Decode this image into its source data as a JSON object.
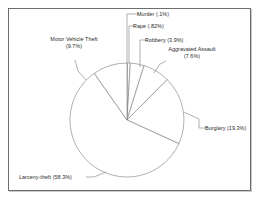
{
  "chart_data": {
    "type": "pie",
    "title": "",
    "subtitle": "",
    "xlabel": "",
    "ylabel": "",
    "legend_position": "none",
    "grid": false,
    "units": "percent",
    "start_angle_deg": 0,
    "direction": "clockwise",
    "categories": [
      "Murder",
      "Rape",
      "Robbery",
      "Aggravated Assault",
      "Burglary",
      "Larceny-theft",
      "Motor Vehicle Theft"
    ],
    "values": [
      0.1,
      0.82,
      3.9,
      7.6,
      19.3,
      58.3,
      9.7
    ],
    "slices": [
      {
        "name": "Murder",
        "value": 0.1,
        "value_text": ".1%",
        "label_line1": "Murder (.1%)",
        "label_line2": ""
      },
      {
        "name": "Rape",
        "value": 0.82,
        "value_text": ".82%",
        "label_line1": "Rape (.82%)",
        "label_line2": ""
      },
      {
        "name": "Robbery",
        "value": 3.9,
        "value_text": "3.9%",
        "label_line1": "Robbery (3.9%)",
        "label_line2": ""
      },
      {
        "name": "Aggravated Assault",
        "value": 7.6,
        "value_text": "7.6%",
        "label_line1": "Aggravated Assault",
        "label_line2": "(7.6%)"
      },
      {
        "name": "Burglary",
        "value": 19.3,
        "value_text": "19.3%",
        "label_line1": "Burglary (19.3%)",
        "label_line2": ""
      },
      {
        "name": "Larceny-theft",
        "value": 58.3,
        "value_text": "58.3%",
        "label_line1": "Larceny-theft (58.3%)",
        "label_line2": ""
      },
      {
        "name": "Motor Vehicle Theft",
        "value": 9.7,
        "value_text": "9.7%",
        "label_line1": "Motor Vehicle Theft",
        "label_line2": "(9.7%)"
      }
    ],
    "colors": {
      "slice_fill": "#ffffff",
      "slice_stroke": "#7a7a7a",
      "leader_line": "#7a7a7a",
      "text": "#2a2a2a",
      "frame_border": "#6d6d6d",
      "background": "#ffffff"
    }
  }
}
